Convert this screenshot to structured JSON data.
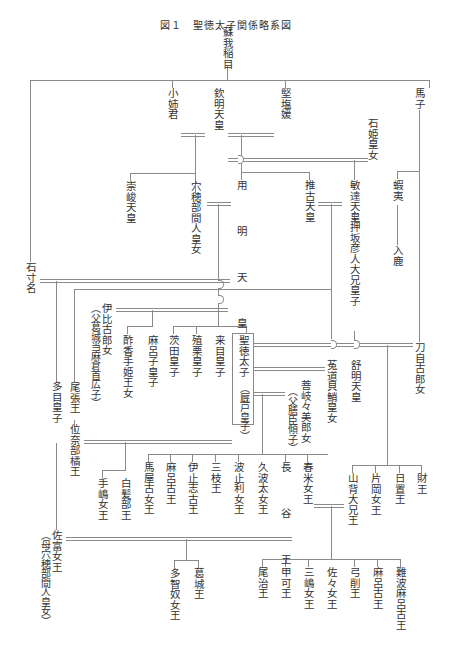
{
  "title": "図１　聖徳太子関係略系図",
  "people": {
    "soga_iname": "蘇我稲目",
    "ohoe": "小姉君",
    "kinmei": "欽明天皇",
    "kitashihime": "堅塩媛",
    "ishihime": "石姫皇女",
    "umako": "馬子",
    "sushun": "崇峻天皇",
    "anahobe": "穴穂部間人皇女",
    "yomei": "用　明　天　皇",
    "suiko": "推古天皇",
    "bidatsu": "敏達天皇",
    "emishi": "蝦夷",
    "iruka": "入鹿",
    "oshisaka": "押坂彦人大兄皇子",
    "ishikina": "石寸名",
    "tojiko": "刀自古郎女",
    "ihiko": "伊比古郎女",
    "ihiko_note": "（父葛城当麻倉首広子）",
    "sukate": "酢香手姫王女",
    "maroko": "麻呂子皇子",
    "umaroko": "茨田皇子",
    "ekuri": "殖栗皇子",
    "kume": "来目皇子",
    "shotoku": "聖徳太子",
    "shotoku_alt": "（厩戸皇子）",
    "uji": "菟道貝鮹皇女",
    "jomei": "舒明天皇",
    "kashiwade": "菩岐々美郎女",
    "kashiwade_note": "（父膳臣傾子）",
    "tame": "多目皇子",
    "owari": "尾張王",
    "inabe": "位奈部橘王",
    "teshima": "手嶋女王",
    "shiraka": "白髪部王",
    "umaya": "馬屋古女王",
    "maroko2": "麻呂古王",
    "ishiko": "伊止志古王",
    "mieda": "三枝王",
    "hatori": "波止利女王",
    "kuhata": "久波太女王",
    "hatsuse": "長　谷　王",
    "haruyone": "春米女王",
    "yamashiro": "山背大兄王",
    "kataoka": "片岡女王",
    "okitama": "日置王",
    "takara": "財王",
    "satomi": "佐富女王",
    "satomi_note": "（母穴穂部間人皇女）",
    "tachinu": "多智奴女王",
    "katsuragi": "葛城王",
    "oji": "尾治王",
    "kafuka": "甲可王",
    "mishima": "三嶋女王",
    "sasa": "佐々女王",
    "yuge": "弓削王",
    "maroko3": "麻呂古王",
    "naniwa": "難波麻呂古王"
  }
}
